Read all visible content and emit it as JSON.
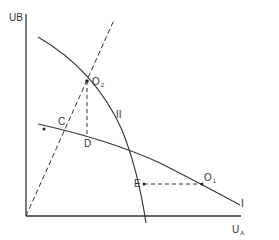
{
  "diagram": {
    "type": "utility-possibility-frontier",
    "axes": {
      "y_label": "UB",
      "x_label_main": "U",
      "x_label_sub": "A"
    },
    "curves": [
      {
        "id": "I",
        "label": "I",
        "style": "solid"
      },
      {
        "id": "II",
        "label": "II",
        "style": "solid"
      }
    ],
    "ray": {
      "style": "dashed",
      "from": "origin"
    },
    "points": {
      "O2": {
        "main": "O",
        "sub": "2"
      },
      "O1": {
        "main": "O",
        "sub": "1"
      },
      "C": {
        "label": "C"
      },
      "D": {
        "label": "D"
      },
      "E": {
        "label": "E"
      }
    },
    "colors": {
      "line": "#333333",
      "background": "#ffffff"
    }
  }
}
